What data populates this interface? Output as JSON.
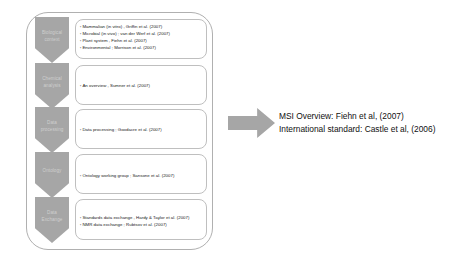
{
  "diagram": {
    "stages": [
      {
        "label": "Biological context",
        "bullets": [
          "Mammalian (in vitro) , Griffin et al. (2007)",
          "Microbial (in vivo) ; van der Werf et al.  (2007)",
          "Plant system , Fiehn et al. (2007)",
          "Environmental ;  Morrison et al. (2007)"
        ]
      },
      {
        "label": "Chemical analysis",
        "bullets": [
          "An overview , Sumner et al. (2007)"
        ]
      },
      {
        "label": "Data processing",
        "bullets": [
          "Data processing ; Goodacre et al. (2007)"
        ]
      },
      {
        "label": "Ontology",
        "bullets": [
          "Ontology working group ; Sansone et al. (2007)"
        ]
      },
      {
        "label": "Data Exchange",
        "bullets": [
          "Standards data exchange , Hardy & Taylor et al. (2007)",
          "NMR data exchange ; Rubtsov et al. (2007)"
        ]
      }
    ],
    "arrow": {
      "name": "right-arrow",
      "direction": "right"
    },
    "caption": {
      "line1": "MSI Overview: Fiehn et al, (2007)",
      "line2": "International standard: Castle et al, (2006)"
    },
    "colors": {
      "chevron_fill": "#a6a6a6",
      "chevron_text": "#cfcfcf",
      "box_border": "#bfbfbf",
      "container_border": "#b0b0b0",
      "arrow_fill": "#a6a6a6",
      "caption_text": "#101010"
    }
  }
}
